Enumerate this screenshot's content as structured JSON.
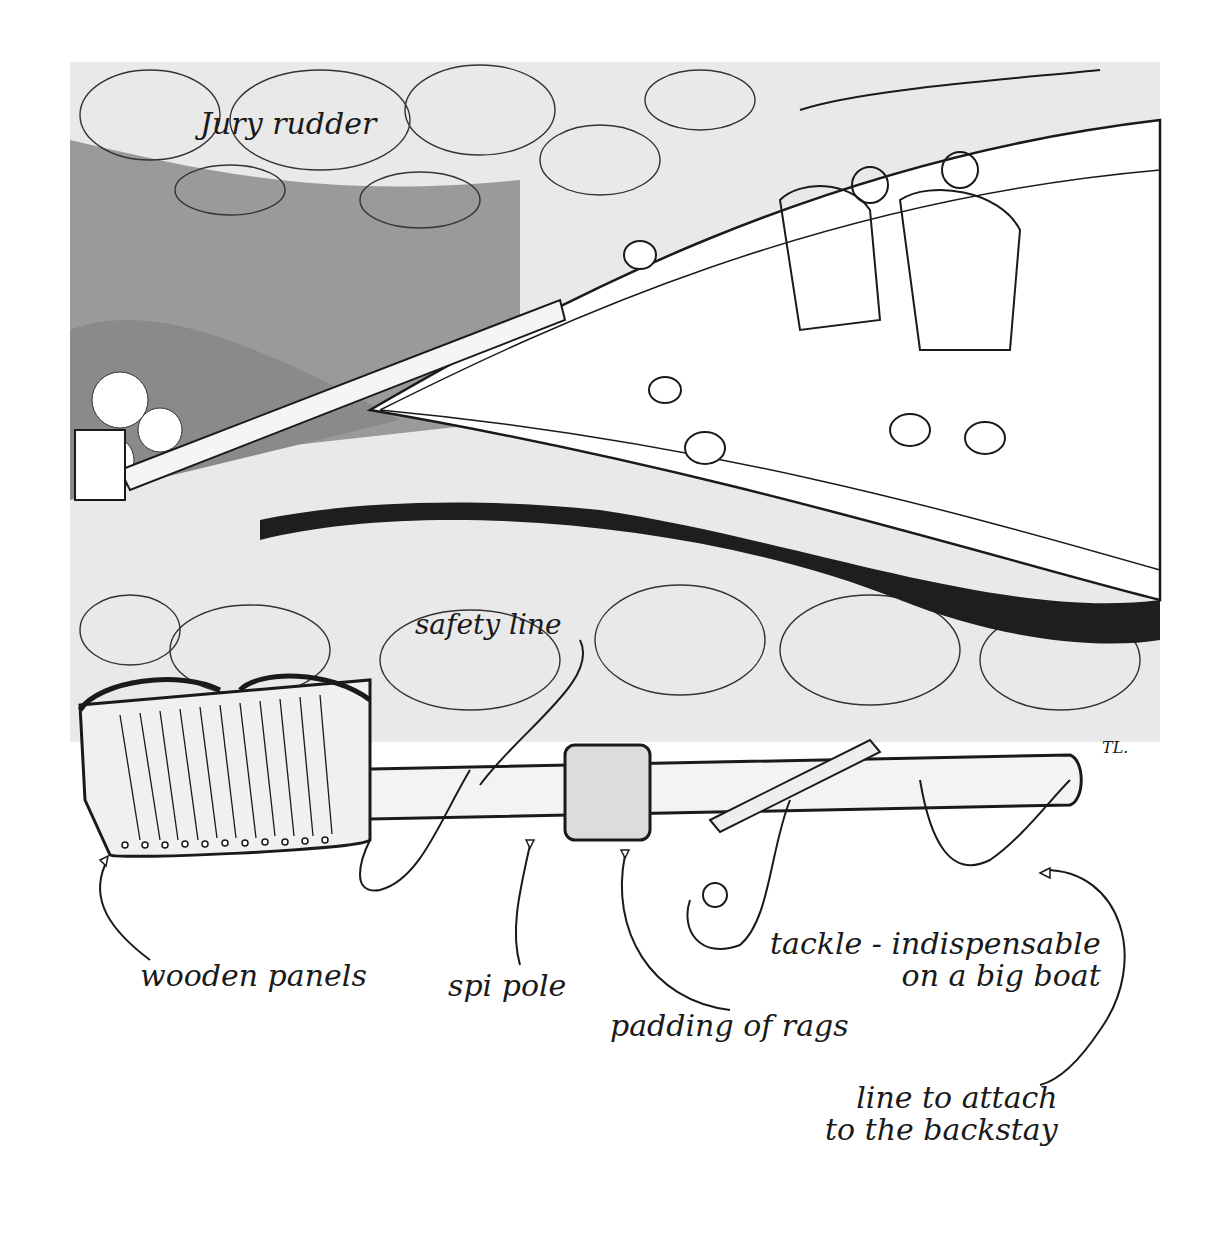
{
  "illustration": {
    "subject": "Jury rudder made from a spinnaker pole and wooden panels, used on a sailboat",
    "title_label": "Jury rudder",
    "signature": "TL."
  },
  "labels": {
    "jury_rudder": "Jury rudder",
    "safety_line": "safety line",
    "wooden_panels": "wooden panels",
    "spi_pole": "spi pole",
    "padding_of_rags": "padding of rags",
    "tackle_line1": "tackle - indispensable",
    "tackle_line2": "on a big boat",
    "backstay_line1": "line to attach",
    "backstay_line2": "to the backstay"
  },
  "colors": {
    "ink": "#1a1a1a",
    "water_dark": "#8a8a8a",
    "water_mid": "#b5b5b5",
    "water_light": "#e6e6e6",
    "paper": "#ffffff"
  }
}
